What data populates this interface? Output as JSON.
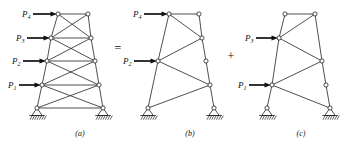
{
  "figure": {
    "background": "#ffffff",
    "line_color": "#222222",
    "load_color": "#111111",
    "width": 360,
    "height": 145
  },
  "operators": [
    {
      "symbol": "=",
      "x": 118,
      "y": 52
    },
    {
      "symbol": "+",
      "x": 231,
      "y": 60
    }
  ],
  "captions": [
    {
      "text": "(a)",
      "x": 80,
      "y": 136
    },
    {
      "text": "(b)",
      "x": 190,
      "y": 136
    },
    {
      "text": "(c)",
      "x": 301,
      "y": 136
    }
  ],
  "panels": [
    {
      "id": "a",
      "caption": "(a)",
      "bracing": "double-diagonal-x",
      "loads": [
        {
          "name": "P4",
          "base": "P",
          "sub": "4",
          "label_x": 22,
          "label_y": 17,
          "tail_x": 33,
          "tail_y": 14,
          "tip_x": 57,
          "tip_y": 14
        },
        {
          "name": "P3",
          "base": "P",
          "sub": "3",
          "label_x": 16,
          "label_y": 41,
          "tail_x": 27,
          "tail_y": 38,
          "tip_x": 50,
          "tip_y": 38
        },
        {
          "name": "P2",
          "base": "P",
          "sub": "2",
          "label_x": 12,
          "label_y": 64,
          "tail_x": 23,
          "tail_y": 61,
          "tip_x": 46,
          "tip_y": 61
        },
        {
          "name": "P1",
          "base": "P",
          "sub": "1",
          "label_x": 8,
          "label_y": 88,
          "tail_x": 19,
          "tail_y": 85,
          "tip_x": 41,
          "tip_y": 85
        }
      ],
      "joints": [
        {
          "id": "L4",
          "x": 58,
          "y": 14
        },
        {
          "id": "R4",
          "x": 88,
          "y": 14
        },
        {
          "id": "L3",
          "x": 51,
          "y": 38
        },
        {
          "id": "R3",
          "x": 91,
          "y": 38
        },
        {
          "id": "L2",
          "x": 47,
          "y": 61
        },
        {
          "id": "R2",
          "x": 95,
          "y": 61
        },
        {
          "id": "L1",
          "x": 42,
          "y": 85
        },
        {
          "id": "R1",
          "x": 99,
          "y": 85
        },
        {
          "id": "L0",
          "x": 37,
          "y": 108
        },
        {
          "id": "R0",
          "x": 103,
          "y": 108
        }
      ],
      "members": [
        [
          "L4",
          "R4"
        ],
        [
          "L4",
          "L3"
        ],
        [
          "L3",
          "L2"
        ],
        [
          "L2",
          "L1"
        ],
        [
          "L1",
          "L0"
        ],
        [
          "R4",
          "R3"
        ],
        [
          "R3",
          "R2"
        ],
        [
          "R2",
          "R1"
        ],
        [
          "R1",
          "R0"
        ],
        [
          "L3",
          "R3"
        ],
        [
          "L2",
          "R2"
        ],
        [
          "L1",
          "R1"
        ],
        [
          "L0",
          "R0"
        ],
        [
          "L4",
          "R3"
        ],
        [
          "R4",
          "L3"
        ],
        [
          "L3",
          "R2"
        ],
        [
          "R3",
          "L2"
        ],
        [
          "L2",
          "R1"
        ],
        [
          "R2",
          "L1"
        ],
        [
          "L1",
          "R0"
        ],
        [
          "R1",
          "L0"
        ]
      ],
      "supports": [
        {
          "id": "support-left",
          "joint": "L0",
          "x": 37,
          "y": 108
        },
        {
          "id": "support-right",
          "joint": "R0",
          "x": 103,
          "y": 108
        }
      ]
    },
    {
      "id": "b",
      "caption": "(b)",
      "bracing": "single-diagonal",
      "loads": [
        {
          "name": "P4",
          "base": "P",
          "sub": "4",
          "label_x": 133,
          "label_y": 17,
          "tail_x": 144,
          "tail_y": 14,
          "tip_x": 168,
          "tip_y": 14
        },
        {
          "name": "P2",
          "base": "P",
          "sub": "2",
          "label_x": 123,
          "label_y": 64,
          "tail_x": 134,
          "tail_y": 61,
          "tip_x": 157,
          "tip_y": 61
        }
      ],
      "joints": [
        {
          "id": "L4",
          "x": 169,
          "y": 14
        },
        {
          "id": "R4",
          "x": 199,
          "y": 14
        },
        {
          "id": "R3",
          "x": 202,
          "y": 38
        },
        {
          "id": "L2",
          "x": 158,
          "y": 61
        },
        {
          "id": "R2",
          "x": 206,
          "y": 61
        },
        {
          "id": "R1",
          "x": 210,
          "y": 85
        },
        {
          "id": "L0",
          "x": 148,
          "y": 108
        },
        {
          "id": "R0",
          "x": 214,
          "y": 108
        }
      ],
      "members": [
        [
          "L4",
          "R4"
        ],
        [
          "L4",
          "L2"
        ],
        [
          "L2",
          "L0"
        ],
        [
          "R4",
          "R3"
        ],
        [
          "R3",
          "R2"
        ],
        [
          "R2",
          "R1"
        ],
        [
          "R1",
          "R0"
        ],
        [
          "L4",
          "R3"
        ],
        [
          "L2",
          "R3"
        ],
        [
          "L2",
          "R1"
        ],
        [
          "L0",
          "R1"
        ]
      ],
      "supports": [
        {
          "id": "support-left",
          "joint": "L0",
          "x": 148,
          "y": 108
        },
        {
          "id": "support-right",
          "joint": "R0",
          "x": 214,
          "y": 108
        }
      ]
    },
    {
      "id": "c",
      "caption": "(c)",
      "bracing": "single-diagonal",
      "loads": [
        {
          "name": "P3",
          "base": "P",
          "sub": "3",
          "label_x": 245,
          "label_y": 41,
          "tail_x": 256,
          "tail_y": 38,
          "tip_x": 278,
          "tip_y": 38
        },
        {
          "name": "P1",
          "base": "P",
          "sub": "1",
          "label_x": 238,
          "label_y": 88,
          "tail_x": 249,
          "tail_y": 85,
          "tip_x": 271,
          "tip_y": 85
        }
      ],
      "joints": [
        {
          "id": "L4",
          "x": 285,
          "y": 14
        },
        {
          "id": "R4",
          "x": 315,
          "y": 14
        },
        {
          "id": "L3",
          "x": 279,
          "y": 38
        },
        {
          "id": "R2",
          "x": 322,
          "y": 61
        },
        {
          "id": "L1",
          "x": 272,
          "y": 85
        },
        {
          "id": "R1",
          "x": 326,
          "y": 85
        },
        {
          "id": "L0",
          "x": 267,
          "y": 108
        },
        {
          "id": "R0",
          "x": 330,
          "y": 108
        }
      ],
      "members": [
        [
          "L4",
          "R4"
        ],
        [
          "L4",
          "L3"
        ],
        [
          "L3",
          "L1"
        ],
        [
          "L1",
          "L0"
        ],
        [
          "R4",
          "R2"
        ],
        [
          "R2",
          "R1"
        ],
        [
          "R1",
          "R0"
        ],
        [
          "L3",
          "R4"
        ],
        [
          "L3",
          "R2"
        ],
        [
          "L1",
          "R2"
        ],
        [
          "L1",
          "R0"
        ]
      ],
      "supports": [
        {
          "id": "support-left",
          "joint": "L0",
          "x": 267,
          "y": 108
        },
        {
          "id": "support-right",
          "joint": "R0",
          "x": 330,
          "y": 108
        }
      ]
    }
  ]
}
